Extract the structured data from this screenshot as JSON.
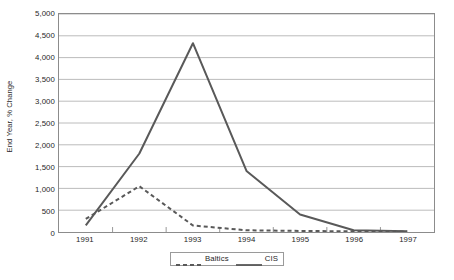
{
  "chart_data": {
    "type": "line",
    "title": "",
    "xlabel": "",
    "ylabel": "End Year, % Change",
    "categories": [
      "1991",
      "1992",
      "1993",
      "1994",
      "1995",
      "1996",
      "1997"
    ],
    "x": [
      1991,
      1992,
      1993,
      1994,
      1995,
      1996,
      1997
    ],
    "ylim": [
      0,
      5000
    ],
    "ytick_values": [
      0,
      500,
      1000,
      1500,
      2000,
      2500,
      3000,
      3500,
      4000,
      4500,
      5000
    ],
    "ytick_labels": [
      "0",
      "500",
      "1,000",
      "1,500",
      "2,000",
      "2,500",
      "3,000",
      "3,500",
      "4,000",
      "4,500",
      "5,000"
    ],
    "grid": "horizontal",
    "legend_position": "bottom-center",
    "series": [
      {
        "name": "Baltics",
        "style": "dashed",
        "color": "#595959",
        "values": [
          300,
          1050,
          150,
          40,
          25,
          15,
          10
        ]
      },
      {
        "name": "CIS",
        "style": "solid",
        "color": "#595959",
        "values": [
          150,
          1800,
          4330,
          1400,
          400,
          40,
          20
        ]
      }
    ]
  },
  "legend": {
    "entries": [
      {
        "label": "Baltics",
        "icon": "dashed-line-icon"
      },
      {
        "label": "CIS",
        "icon": "solid-line-icon"
      }
    ]
  },
  "colors": {
    "series_line": "#595959",
    "grid": "#b4b4b4",
    "plot_border": "#8c8c8c",
    "text": "#1f1f1f",
    "background": "#ffffff"
  }
}
